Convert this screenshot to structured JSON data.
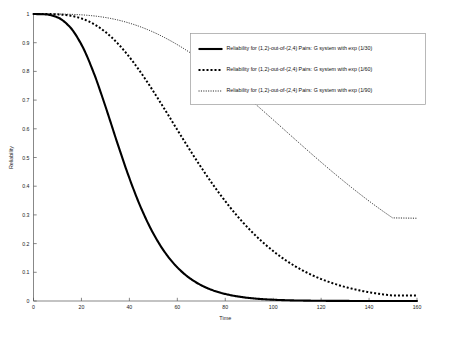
{
  "chart_data": {
    "type": "line",
    "title": "",
    "xlabel": "Time",
    "ylabel": "Reliability",
    "xlim": [
      0,
      160
    ],
    "ylim": [
      0,
      1
    ],
    "grid": false,
    "legend_position": "top-right",
    "xticks": [
      0,
      20,
      40,
      60,
      80,
      100,
      120,
      140,
      160
    ],
    "xtick_labels": [
      "0",
      "20",
      "40",
      "60",
      "80",
      "100",
      "120",
      "140",
      "160"
    ],
    "yticks": [
      0,
      0.1,
      0.2,
      0.3,
      0.4,
      0.5,
      0.6,
      0.7,
      0.8,
      0.9,
      1
    ],
    "ytick_labels": [
      "0",
      "0.1",
      "0.2",
      "0.3",
      "0.4",
      "0.5",
      "0.6",
      "0.7",
      "0.8",
      "0.9",
      "1"
    ],
    "x": [
      0,
      5,
      10,
      15,
      20,
      25,
      30,
      35,
      40,
      45,
      50,
      55,
      60,
      65,
      70,
      75,
      80,
      85,
      90,
      95,
      100,
      105,
      110,
      115,
      120,
      125,
      130,
      135,
      140,
      145,
      150
    ],
    "series": [
      {
        "name": "Reliability for (1,2)-out-of-(2,4) Pairs: G system with exp (1/30)",
        "style": "solid",
        "rate": "1/30",
        "mean": 30,
        "color": "#000000",
        "values": [
          1.0,
          0.9988,
          0.9884,
          0.9565,
          0.8934,
          0.7978,
          0.6784,
          0.5501,
          0.4281,
          0.3217,
          0.2349,
          0.1675,
          0.1171,
          0.0806,
          0.0547,
          0.0367,
          0.0244,
          0.0161,
          0.0105,
          0.0068,
          0.0044,
          0.0028,
          0.0018,
          0.0012,
          0.0007,
          0.0005,
          0.0003,
          0.0002,
          0.0001,
          0.0001,
          0.0
        ]
      },
      {
        "name": "Reliability for (1,2)-out-of-(2,4) Pairs: G system with exp (1/60)",
        "style": "dotted-thick",
        "rate": "1/60",
        "mean": 60,
        "color": "#000000",
        "values": [
          1.0,
          0.9999,
          0.9988,
          0.9947,
          0.9845,
          0.9659,
          0.9374,
          0.8986,
          0.8501,
          0.7934,
          0.7306,
          0.6642,
          0.5965,
          0.5295,
          0.465,
          0.4041,
          0.3478,
          0.2964,
          0.2504,
          0.2096,
          0.174,
          0.1432,
          0.1171,
          0.095,
          0.0766,
          0.0614,
          0.0489,
          0.0387,
          0.0305,
          0.024,
          0.0188
        ]
      },
      {
        "name": "Reliability for (1,2)-out-of-(2,4) Pairs: G system with exp (1/90)",
        "style": "dotted-fine",
        "rate": "1/90",
        "mean": 90,
        "color": "#000000",
        "values": [
          1.0,
          1.0,
          0.9998,
          0.999,
          0.9971,
          0.9935,
          0.9878,
          0.9795,
          0.9683,
          0.9542,
          0.9369,
          0.9165,
          0.8932,
          0.8671,
          0.8385,
          0.8076,
          0.7748,
          0.7404,
          0.7048,
          0.6683,
          0.6313,
          0.594,
          0.5568,
          0.5199,
          0.4836,
          0.4481,
          0.4136,
          0.3803,
          0.3482,
          0.3176,
          0.2884
        ]
      }
    ]
  },
  "legend": {
    "entries": [
      {
        "label": "Reliability for (1,2)-out-of-(2,4) Pairs: G system with exp (1/30)",
        "style": "solid"
      },
      {
        "label": "Reliability for (1,2)-out-of-(2,4) Pairs: G system with exp (1/60)",
        "style": "dotted-thick"
      },
      {
        "label": "Reliability for (1,2)-out-of-(2,4) Pairs: G system with exp (1/90)",
        "style": "dotted-fine"
      }
    ]
  }
}
